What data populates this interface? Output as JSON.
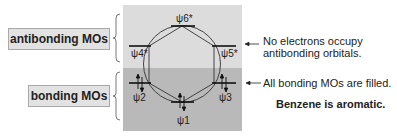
{
  "labels": {
    "antibonding": "antibonding MOs",
    "bonding": "bonding MOs"
  },
  "orbitals": {
    "psi1": "ψ1",
    "psi2": "ψ2",
    "psi3": "ψ3",
    "psi4": "ψ4*",
    "psi5": "ψ5*",
    "psi6": "ψ6*"
  },
  "annotations": {
    "antibonding_note_line1": "No electrons occupy",
    "antibonding_note_line2": "antibonding orbitals.",
    "bonding_note": "All bonding MOs are filled.",
    "conclusion": "Benzene is aromatic."
  },
  "colors": {
    "antibonding_region": "#dcdcdc",
    "bonding_region": "#b9b9b9",
    "label_box": "#e2e2e2",
    "line": "#1a1a1a"
  }
}
